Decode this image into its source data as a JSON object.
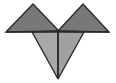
{
  "canvas": {
    "width": 116,
    "height": 83,
    "background": "#ffffff"
  },
  "figure": {
    "name": "tangram-heart-figure",
    "stroke_color": "#2b2b2b",
    "stroke_width": 1.4
  },
  "palette": {
    "dark_gray": "#787878",
    "mid_gray": "#9a9a9a",
    "light_gray": "#b0b0b0",
    "outline": "#2b2b2b",
    "white": "#ffffff"
  },
  "shapes": [
    {
      "id": "upper-left-triangle",
      "label": "Upper left triangle",
      "fill": "#787878",
      "points": "6,32 33,4 59,31"
    },
    {
      "id": "upper-right-triangle",
      "label": "Upper right triangle",
      "fill": "#787878",
      "points": "58,31 83,4 109,32"
    },
    {
      "id": "lower-left-triangle",
      "label": "Lower left triangle",
      "fill": "#a8a8a8",
      "points": "32,32 58,31 58,79"
    },
    {
      "id": "lower-right-triangle",
      "label": "Lower right triangle",
      "fill": "#a0a0a0",
      "points": "58,31 84,32 58,79"
    }
  ],
  "lines": [
    {
      "id": "horizontal-baseline-left",
      "label": "Left horizontal base line",
      "from": "6,32",
      "to": "58,32"
    },
    {
      "id": "horizontal-baseline-right",
      "label": "Right horizontal base line",
      "from": "58,32",
      "to": "109,32"
    },
    {
      "id": "center-vertical-line",
      "label": "Central vertical divider",
      "from": "58,31",
      "to": "58,79"
    }
  ]
}
